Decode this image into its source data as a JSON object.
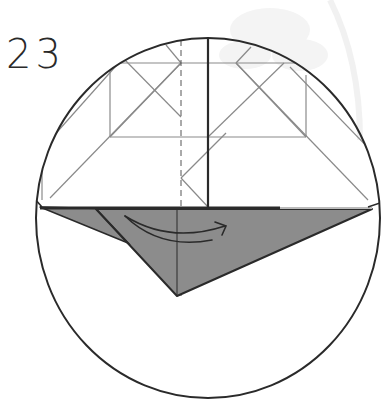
{
  "step": {
    "number": "23"
  },
  "colors": {
    "background": "#ffffff",
    "outline": "#2a2a2a",
    "crease": "#8a8a8a",
    "paper_gray": "#8c8c8c",
    "watermark": "#f1f1f1"
  },
  "diagram": {
    "frame": "circle",
    "fold_arrow": "curved-arrow-left-to-right",
    "valley_fold_line": "dashed-vertical"
  }
}
